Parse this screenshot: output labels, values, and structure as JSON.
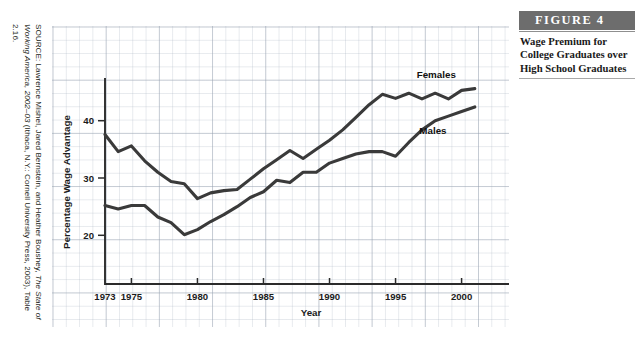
{
  "source_note": {
    "prefix": "SOURCE: Lawrence Mishel, Jared Bernstein, and Heather Boushey, ",
    "italic_part": "The State of Working America, 2002–03",
    "suffix": " (Ithaca, N.Y.: Cornell University Press, 2003), Table 2.16."
  },
  "figure": {
    "label": "FIGURE  4",
    "caption": "Wage Premium for College Graduates over High School Graduates"
  },
  "chart_data": {
    "type": "line",
    "title": "",
    "xlabel": "Year",
    "ylabel": "Percentage Wage Advantage",
    "xlim": [
      1973,
      2002
    ],
    "ylim": [
      11.5,
      48.5
    ],
    "xticks": [
      1973,
      1975,
      1980,
      1985,
      1990,
      1995,
      2000
    ],
    "yticks": [
      20,
      30,
      40
    ],
    "grid": true,
    "grid_style": "graph-paper-background",
    "legend_position": "inline-labels",
    "line_color": "#3a3a3a",
    "x": [
      1973,
      1974,
      1975,
      1976,
      1977,
      1978,
      1979,
      1980,
      1981,
      1982,
      1983,
      1984,
      1985,
      1986,
      1987,
      1988,
      1989,
      1990,
      1991,
      1992,
      1993,
      1994,
      1995,
      1996,
      1997,
      1998,
      1999,
      2000,
      2001
    ],
    "series": [
      {
        "name": "Females",
        "label": "Females",
        "values": [
          37.6,
          34.6,
          35.6,
          33.0,
          31.0,
          29.4,
          29.0,
          26.4,
          27.4,
          27.8,
          28.0,
          29.8,
          31.6,
          33.2,
          34.8,
          33.4,
          35.0,
          36.6,
          38.4,
          40.6,
          42.8,
          44.6,
          43.9,
          44.8,
          43.8,
          44.8,
          43.8,
          45.3,
          45.6
        ]
      },
      {
        "name": "Males",
        "label": "Males",
        "values": [
          25.2,
          24.6,
          25.2,
          25.2,
          23.2,
          22.2,
          20.1,
          21.0,
          22.4,
          23.6,
          25.0,
          26.6,
          27.6,
          29.6,
          29.2,
          31.0,
          31.0,
          32.6,
          33.4,
          34.2,
          34.6,
          34.6,
          33.8,
          36.2,
          38.4,
          40.0,
          40.8,
          41.6,
          42.4
        ]
      }
    ],
    "annotations": [
      {
        "text": "Females",
        "x": 1996.6,
        "y": 47.4
      },
      {
        "text": "Males",
        "x": 1996.8,
        "y": 37.6
      }
    ]
  }
}
